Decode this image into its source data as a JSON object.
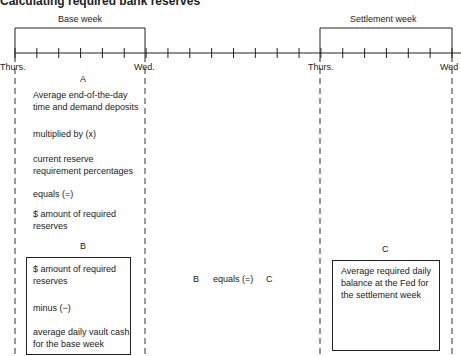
{
  "title": "Calculating required bank reserves",
  "brackets": {
    "base_week": "Base week",
    "settlement_week": "Settlement week"
  },
  "timeline": {
    "tick_count": 21,
    "labels": [
      "Thurs.",
      "Wed.",
      "Thurs.",
      "Wed"
    ]
  },
  "section_a": {
    "letter": "A",
    "lines": [
      "Average end-of-the-day time and demand deposits",
      "multiplied by (x)",
      "current reserve requirement percentages",
      "equals (=)",
      "$ amount of required reserves"
    ]
  },
  "section_b": {
    "letter": "B",
    "lines": [
      "$ amount of required reserves",
      "minus (−)",
      "average daily vault cash for the base week"
    ]
  },
  "equation": {
    "left": "B",
    "op": "equals (=)",
    "right": "C"
  },
  "section_c": {
    "letter": "C",
    "lines": [
      "Average required daily balance at the Fed for the settlement week"
    ]
  }
}
